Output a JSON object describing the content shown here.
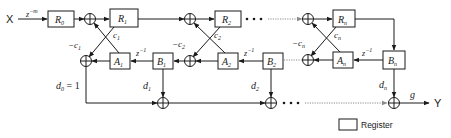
{
  "diagram": {
    "input_label": "X",
    "output_label": "Y",
    "input_delay": {
      "base": "z",
      "exp": "−m"
    },
    "registers_top": [
      {
        "name": "R",
        "sub": "0"
      },
      {
        "name": "R",
        "sub": "1"
      },
      {
        "name": "R",
        "sub": "2"
      },
      {
        "name": "R",
        "sub": "n"
      }
    ],
    "registers_A": [
      {
        "name": "A",
        "sub": "1"
      },
      {
        "name": "A",
        "sub": "2"
      },
      {
        "name": "A",
        "sub": "n"
      }
    ],
    "registers_B": [
      {
        "name": "B",
        "sub": "1"
      },
      {
        "name": "B",
        "sub": "2"
      },
      {
        "name": "B",
        "sub": "n"
      }
    ],
    "coefficients_c": [
      {
        "name": "c",
        "sub": "1"
      },
      {
        "name": "c",
        "sub": "2"
      },
      {
        "name": "c",
        "sub": "n"
      }
    ],
    "coefficients_neg_c": [
      {
        "name": "−c",
        "sub": "1"
      },
      {
        "name": "−c",
        "sub": "2"
      },
      {
        "name": "−c",
        "sub": "n"
      }
    ],
    "delays": [
      {
        "base": "z",
        "exp": "−1"
      },
      {
        "base": "z",
        "exp": "−1"
      },
      {
        "base": "z",
        "exp": "−1"
      }
    ],
    "taps_d": [
      {
        "name": "d",
        "sub": "0",
        "suffix": " = 1"
      },
      {
        "name": "d",
        "sub": "1",
        "suffix": ""
      },
      {
        "name": "d",
        "sub": "2",
        "suffix": ""
      },
      {
        "name": "d",
        "sub": "n",
        "suffix": ""
      }
    ],
    "gain_label": "g",
    "ellipsis": "• • •"
  },
  "legend": {
    "label": "Register"
  }
}
